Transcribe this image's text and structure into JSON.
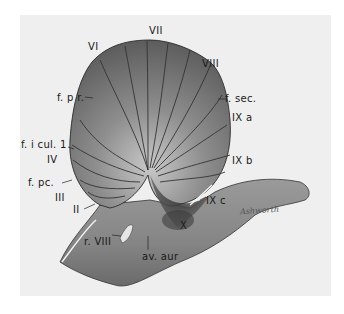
{
  "figure": {
    "signature": "Ashworth",
    "labels": {
      "VII": "VII",
      "VI": "VI",
      "VIII": "VIII",
      "f_pr": "f. p r.",
      "f_sec": "f. sec.",
      "IXa": "IX a",
      "f_icul": "f. i cul. 1",
      "IV": "IV",
      "IXb": "IX b",
      "f_pc": "f. pc.",
      "III": "III",
      "II": "II",
      "IXc": "IX c",
      "X": "X",
      "r_VIII": "r. VIII",
      "I": "I",
      "av_aur": "av. aur"
    },
    "colors": {
      "background": "#efefef",
      "tissue_light": "#a8a8a8",
      "tissue_dark": "#5a5a5a",
      "outline": "#2a2a2a"
    }
  }
}
